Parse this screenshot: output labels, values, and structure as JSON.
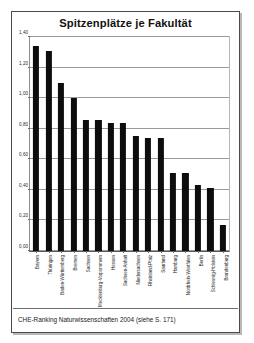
{
  "figure": {
    "caption": "CHE-Ranking Naturwissenschaften 2004 (siehe S. 171)"
  },
  "chart_data": {
    "type": "bar",
    "title": "Spitzenplätze je Fakultät",
    "xlabel": "",
    "ylabel": "",
    "ylim": [
      0.0,
      1.4
    ],
    "ytick_step": 0.2,
    "ytick_labels": [
      "0,00",
      "0,20",
      "0,40",
      "0,60",
      "0,80",
      "1,00",
      "1,20",
      "1,40"
    ],
    "ytick_values": [
      0.0,
      0.2,
      0.4,
      0.6,
      0.8,
      1.0,
      1.2,
      1.4
    ],
    "grid": true,
    "legend": false,
    "bar_color": "#0d0d0d",
    "categories": [
      "Bayern",
      "Thüringen",
      "Baden-Württemberg",
      "Bremen",
      "Sachsen",
      "Mecklenburg-Vorpommern",
      "Hessen",
      "Sachsen-Anhalt",
      "Niedersachsen",
      "Rheinland-Pfalz",
      "Saarland",
      "Hamburg",
      "Nordrhein-Westfalen",
      "Berlin",
      "Schleswig-Holstein",
      "Brandenburg"
    ],
    "values": [
      1.34,
      1.31,
      1.1,
      1.0,
      0.86,
      0.86,
      0.84,
      0.84,
      0.75,
      0.74,
      0.74,
      0.51,
      0.51,
      0.43,
      0.41,
      0.17
    ]
  }
}
